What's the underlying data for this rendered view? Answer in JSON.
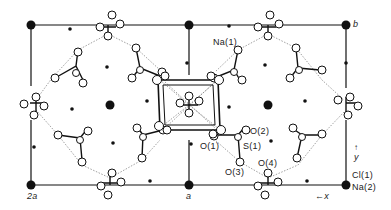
{
  "figure": {
    "type": "crystal-structure-projection",
    "axes": {
      "x_label": "x",
      "y_label": "y"
    },
    "corner_labels": {
      "origin_left": "2a",
      "origin_mid": "a",
      "top_right": "b"
    },
    "atom_labels": {
      "na1": "Na(1)",
      "o1": "O(1)",
      "o2": "O(2)",
      "s1": "S(1)",
      "o3": "O(3)",
      "o4": "O(4)",
      "cl1": "Cl(1)",
      "na2": "Na(2)"
    },
    "colors": {
      "ink": "#111111",
      "background": "#ffffff",
      "bond_dashed": "#777777"
    }
  }
}
